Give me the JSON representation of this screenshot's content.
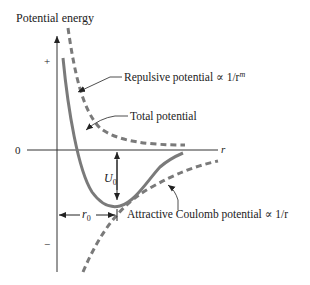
{
  "diagram": {
    "y_axis_label": "Potential energy",
    "x_axis_label": "r",
    "zero_label": "0",
    "plus_label": "+",
    "minus_label": "−",
    "annotations": {
      "repulsive": "Repulsive potential ∝ 1/r",
      "repulsive_exp": "m",
      "total": "Total potential",
      "attractive": "Attractive Coulomb potential ∝ 1/r",
      "well_depth": "U",
      "well_depth_sub": "0",
      "equilibrium": "r",
      "equilibrium_sub": "0"
    },
    "colors": {
      "curves": "#7a7a7a",
      "axes": "#333333",
      "text": "#222222"
    }
  }
}
